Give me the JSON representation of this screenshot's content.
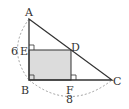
{
  "diagram": {
    "type": "geometry",
    "points": {
      "A": {
        "label": "A",
        "x": 29,
        "y": 19
      },
      "B": {
        "label": "B",
        "x": 29,
        "y": 80
      },
      "C": {
        "label": "C",
        "x": 112,
        "y": 80
      },
      "D": {
        "label": "D",
        "x": 71,
        "y": 50
      },
      "E": {
        "label": "E",
        "x": 29,
        "y": 50
      },
      "F": {
        "label": "F",
        "x": 71,
        "y": 80
      }
    },
    "measurements": {
      "AB": "6",
      "BC": "8"
    },
    "shaded_region": "EBFD",
    "right_angles": [
      "B",
      "E",
      "F"
    ],
    "colors": {
      "line": "#333333",
      "shade": "#dcdcdc",
      "dashed": "#888888"
    }
  }
}
